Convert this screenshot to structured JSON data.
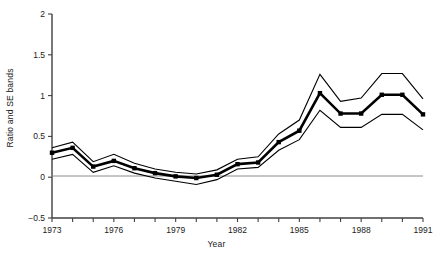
{
  "chart_data": {
    "type": "line",
    "title": "",
    "xlabel": "Year",
    "ylabel": "Ratio and SE bands",
    "xlim": [
      1973,
      1991
    ],
    "ylim": [
      -0.5,
      2
    ],
    "grid": false,
    "legend": "none",
    "x": [
      1973,
      1974,
      1975,
      1976,
      1977,
      1978,
      1979,
      1980,
      1981,
      1982,
      1983,
      1984,
      1985,
      1986,
      1987,
      1988,
      1989,
      1990,
      1991
    ],
    "xticks": [
      "1973",
      "1976",
      "1979",
      "1982",
      "1985",
      "1988",
      "1991"
    ],
    "xtick_values": [
      1973,
      1976,
      1979,
      1982,
      1985,
      1988,
      1991
    ],
    "yticks": [
      "-0.5",
      "0",
      "0.5",
      "1",
      "1.5",
      "2"
    ],
    "ytick_values": [
      -0.5,
      0,
      0.5,
      1,
      1.5,
      2
    ],
    "zero_line": 0,
    "series": [
      {
        "name": "Ratio",
        "style": "thick-line-with-square-markers",
        "values": [
          0.3,
          0.36,
          0.13,
          0.2,
          0.11,
          0.05,
          0.01,
          -0.01,
          0.03,
          0.16,
          0.18,
          0.43,
          0.57,
          1.03,
          0.78,
          0.78,
          1.01,
          1.01,
          0.77
        ]
      },
      {
        "name": "Upper SE band",
        "style": "thin-line",
        "values": [
          0.36,
          0.43,
          0.19,
          0.28,
          0.17,
          0.1,
          0.06,
          0.04,
          0.09,
          0.22,
          0.25,
          0.53,
          0.7,
          1.26,
          0.93,
          0.97,
          1.27,
          1.27,
          0.96
        ]
      },
      {
        "name": "Lower SE band",
        "style": "thin-line",
        "values": [
          0.22,
          0.28,
          0.06,
          0.14,
          0.05,
          -0.01,
          -0.05,
          -0.09,
          -0.03,
          0.1,
          0.12,
          0.33,
          0.46,
          0.82,
          0.61,
          0.61,
          0.77,
          0.77,
          0.58
        ]
      }
    ],
    "colors": {
      "line": "#000000",
      "axis": "#404040",
      "zero_line": "#808080",
      "background": "#ffffff"
    }
  }
}
